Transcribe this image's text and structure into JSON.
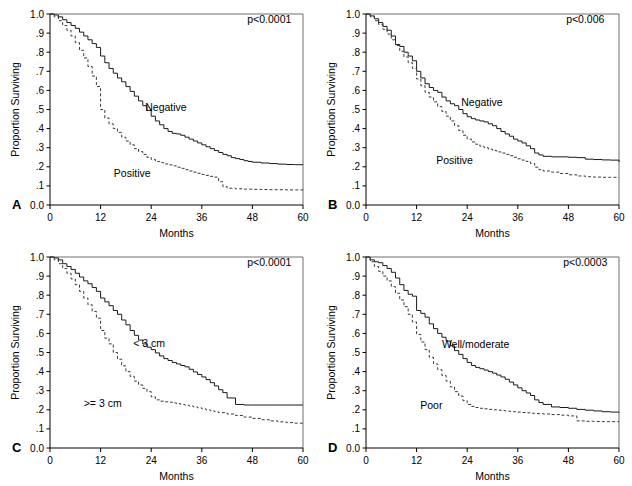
{
  "figure": {
    "title": "",
    "panel_count": 4,
    "shared": {
      "xlabel": "Months",
      "ylabel": "Proportion Surviving",
      "xticks": [
        "0",
        "12",
        "24",
        "36",
        "48",
        "60"
      ],
      "xtick_values": [
        0,
        12,
        24,
        36,
        48,
        60
      ],
      "yticks": [
        "0.0",
        ".1",
        ".2",
        ".3",
        ".4",
        ".5",
        ".6",
        ".7",
        ".8",
        ".9",
        "1.0"
      ],
      "ytick_values": [
        0.0,
        0.1,
        0.2,
        0.3,
        0.4,
        0.5,
        0.6,
        0.7,
        0.8,
        0.9,
        1.0
      ],
      "xlim": [
        0,
        60
      ],
      "ylim": [
        0,
        1
      ]
    }
  },
  "chart_data": [
    {
      "panel": "A",
      "type": "line",
      "title": "",
      "xlabel": "Months",
      "ylabel": "Proportion Surviving",
      "xlim": [
        0,
        60
      ],
      "ylim": [
        0,
        1
      ],
      "grid": false,
      "annotation": "p<0.0001",
      "annotation_pos": [
        52,
        0.955
      ],
      "legend": "inline-labels",
      "series": [
        {
          "name": "Negative",
          "style": "solid",
          "label_pos": [
            27.5,
            0.49
          ],
          "x": [
            0,
            1,
            2,
            3,
            4,
            5,
            6,
            7,
            8,
            9,
            10,
            11,
            12,
            13,
            14,
            15,
            16,
            17,
            18,
            19,
            20,
            21,
            22,
            23,
            24,
            25,
            26,
            27,
            28,
            29,
            30,
            31,
            32,
            33,
            34,
            35,
            36,
            37,
            38,
            39,
            40,
            41,
            42,
            43,
            44,
            45,
            46,
            47,
            48,
            50,
            52,
            54,
            56,
            58,
            60
          ],
          "y": [
            1.0,
            0.995,
            0.985,
            0.97,
            0.955,
            0.94,
            0.925,
            0.905,
            0.885,
            0.865,
            0.845,
            0.825,
            0.78,
            0.745,
            0.715,
            0.69,
            0.665,
            0.645,
            0.62,
            0.595,
            0.57,
            0.545,
            0.52,
            0.495,
            0.465,
            0.44,
            0.42,
            0.4,
            0.385,
            0.375,
            0.372,
            0.365,
            0.355,
            0.345,
            0.335,
            0.325,
            0.315,
            0.305,
            0.295,
            0.285,
            0.275,
            0.265,
            0.258,
            0.248,
            0.243,
            0.238,
            0.232,
            0.228,
            0.224,
            0.22,
            0.217,
            0.214,
            0.212,
            0.211,
            0.21
          ]
        },
        {
          "name": "Positive",
          "style": "dashed",
          "label_pos": [
            19.5,
            0.145
          ],
          "x": [
            0,
            1,
            2,
            3,
            4,
            5,
            6,
            7,
            8,
            9,
            10,
            11,
            12,
            13,
            14,
            15,
            16,
            17,
            18,
            19,
            20,
            21,
            22,
            23,
            24,
            25,
            26,
            27,
            28,
            29,
            30,
            31,
            32,
            33,
            34,
            35,
            36,
            37,
            38,
            39,
            40,
            41,
            42,
            44,
            46,
            48,
            50,
            52,
            54,
            56,
            58,
            60
          ],
          "y": [
            1.0,
            0.985,
            0.965,
            0.94,
            0.915,
            0.885,
            0.85,
            0.81,
            0.77,
            0.725,
            0.675,
            0.62,
            0.5,
            0.455,
            0.425,
            0.4,
            0.38,
            0.355,
            0.335,
            0.315,
            0.295,
            0.28,
            0.265,
            0.25,
            0.238,
            0.228,
            0.222,
            0.215,
            0.21,
            0.205,
            0.198,
            0.192,
            0.185,
            0.178,
            0.172,
            0.166,
            0.16,
            0.155,
            0.15,
            0.146,
            0.122,
            0.096,
            0.088,
            0.085,
            0.083,
            0.082,
            0.081,
            0.08,
            0.08,
            0.079,
            0.079,
            0.078
          ]
        }
      ]
    },
    {
      "panel": "B",
      "type": "line",
      "title": "",
      "xlabel": "Months",
      "ylabel": "Proportion Surviving",
      "xlim": [
        0,
        60
      ],
      "ylim": [
        0,
        1
      ],
      "grid": false,
      "annotation": "p<0.006",
      "annotation_pos": [
        52,
        0.955
      ],
      "legend": "inline-labels",
      "series": [
        {
          "name": "Negative",
          "style": "solid",
          "label_pos": [
            27.5,
            0.52
          ],
          "x": [
            0,
            1,
            2,
            3,
            4,
            5,
            6,
            7,
            8,
            9,
            10,
            11,
            12,
            13,
            14,
            15,
            16,
            17,
            18,
            19,
            20,
            21,
            22,
            23,
            24,
            25,
            26,
            27,
            28,
            29,
            30,
            31,
            32,
            33,
            34,
            35,
            36,
            37,
            38,
            39,
            40,
            41,
            42,
            44,
            46,
            48,
            50,
            52,
            54,
            56,
            58,
            60
          ],
          "y": [
            1.0,
            0.99,
            0.975,
            0.955,
            0.935,
            0.915,
            0.885,
            0.84,
            0.83,
            0.8,
            0.78,
            0.755,
            0.7,
            0.665,
            0.635,
            0.615,
            0.6,
            0.59,
            0.565,
            0.545,
            0.53,
            0.52,
            0.5,
            0.478,
            0.462,
            0.452,
            0.445,
            0.44,
            0.435,
            0.425,
            0.415,
            0.4,
            0.385,
            0.372,
            0.36,
            0.345,
            0.335,
            0.325,
            0.31,
            0.295,
            0.272,
            0.262,
            0.255,
            0.252,
            0.252,
            0.25,
            0.248,
            0.24,
            0.238,
            0.236,
            0.235,
            0.225
          ]
        },
        {
          "name": "Positive",
          "style": "dashed",
          "label_pos": [
            21,
            0.215
          ],
          "x": [
            0,
            1,
            2,
            3,
            4,
            5,
            6,
            7,
            8,
            9,
            10,
            11,
            12,
            13,
            14,
            15,
            16,
            17,
            18,
            19,
            20,
            21,
            22,
            23,
            24,
            25,
            26,
            27,
            28,
            29,
            30,
            31,
            32,
            33,
            34,
            35,
            36,
            37,
            38,
            39,
            40,
            41,
            42,
            44,
            46,
            48,
            50,
            52,
            54,
            56,
            58,
            60
          ],
          "y": [
            1.0,
            0.985,
            0.965,
            0.945,
            0.92,
            0.895,
            0.865,
            0.835,
            0.805,
            0.775,
            0.745,
            0.715,
            0.66,
            0.625,
            0.59,
            0.565,
            0.54,
            0.515,
            0.49,
            0.465,
            0.44,
            0.415,
            0.39,
            0.365,
            0.345,
            0.33,
            0.318,
            0.308,
            0.3,
            0.292,
            0.285,
            0.278,
            0.272,
            0.265,
            0.258,
            0.25,
            0.242,
            0.235,
            0.228,
            0.218,
            0.198,
            0.185,
            0.178,
            0.172,
            0.165,
            0.158,
            0.152,
            0.148,
            0.146,
            0.145,
            0.145,
            0.145
          ]
        }
      ]
    },
    {
      "panel": "C",
      "type": "line",
      "title": "",
      "xlabel": "Months",
      "ylabel": "Proportion Surviving",
      "xlim": [
        0,
        60
      ],
      "ylim": [
        0,
        1
      ],
      "grid": false,
      "annotation": "p<0.0001",
      "annotation_pos": [
        52,
        0.955
      ],
      "legend": "inline-labels",
      "series": [
        {
          "name": "< 3 cm",
          "style": "solid",
          "label_pos": [
            23.5,
            0.53
          ],
          "x": [
            0,
            1,
            2,
            3,
            4,
            5,
            6,
            7,
            8,
            9,
            10,
            11,
            12,
            13,
            14,
            15,
            16,
            17,
            18,
            19,
            20,
            21,
            22,
            23,
            24,
            25,
            26,
            27,
            28,
            29,
            30,
            31,
            32,
            33,
            34,
            35,
            36,
            37,
            38,
            39,
            40,
            41,
            42,
            44,
            46,
            48,
            50,
            52,
            54,
            56,
            58,
            60
          ],
          "y": [
            1.0,
            0.995,
            0.985,
            0.965,
            0.95,
            0.935,
            0.915,
            0.895,
            0.875,
            0.86,
            0.84,
            0.82,
            0.785,
            0.765,
            0.745,
            0.72,
            0.7,
            0.67,
            0.645,
            0.615,
            0.59,
            0.565,
            0.545,
            0.528,
            0.515,
            0.498,
            0.482,
            0.468,
            0.458,
            0.448,
            0.44,
            0.432,
            0.425,
            0.412,
            0.398,
            0.385,
            0.372,
            0.358,
            0.342,
            0.325,
            0.305,
            0.29,
            0.262,
            0.228,
            0.225,
            0.225,
            0.225,
            0.225,
            0.225,
            0.225,
            0.225,
            0.225
          ]
        },
        {
          "name": ">= 3 cm",
          "style": "dashed",
          "label_pos": [
            12.5,
            0.215
          ],
          "x": [
            0,
            1,
            2,
            3,
            4,
            5,
            6,
            7,
            8,
            9,
            10,
            11,
            12,
            13,
            14,
            15,
            16,
            17,
            18,
            19,
            20,
            21,
            22,
            23,
            24,
            25,
            26,
            27,
            28,
            29,
            30,
            31,
            32,
            33,
            34,
            35,
            36,
            37,
            38,
            39,
            40,
            42,
            44,
            46,
            48,
            50,
            52,
            54,
            56,
            58,
            60
          ],
          "y": [
            1.0,
            0.985,
            0.965,
            0.94,
            0.915,
            0.885,
            0.855,
            0.82,
            0.785,
            0.75,
            0.715,
            0.68,
            0.615,
            0.575,
            0.545,
            0.5,
            0.465,
            0.43,
            0.4,
            0.375,
            0.35,
            0.33,
            0.312,
            0.295,
            0.268,
            0.252,
            0.245,
            0.242,
            0.24,
            0.236,
            0.232,
            0.228,
            0.224,
            0.22,
            0.215,
            0.21,
            0.205,
            0.2,
            0.195,
            0.19,
            0.185,
            0.178,
            0.17,
            0.162,
            0.155,
            0.148,
            0.142,
            0.137,
            0.133,
            0.13,
            0.128
          ]
        }
      ]
    },
    {
      "panel": "D",
      "type": "line",
      "title": "",
      "xlabel": "Months",
      "ylabel": "Proportion Surviving",
      "xlim": [
        0,
        60
      ],
      "ylim": [
        0,
        1
      ],
      "grid": false,
      "annotation": "p<0.0003",
      "annotation_pos": [
        52,
        0.955
      ],
      "legend": "inline-labels",
      "series": [
        {
          "name": "Well/moderate",
          "style": "solid",
          "label_pos": [
            26,
            0.525
          ],
          "x": [
            0,
            1,
            2,
            3,
            4,
            5,
            6,
            7,
            8,
            9,
            10,
            11,
            12,
            13,
            14,
            15,
            16,
            17,
            18,
            19,
            20,
            21,
            22,
            23,
            24,
            25,
            26,
            27,
            28,
            29,
            30,
            31,
            32,
            33,
            34,
            35,
            36,
            37,
            38,
            39,
            40,
            41,
            42,
            44,
            46,
            48,
            50,
            52,
            54,
            56,
            58,
            60
          ],
          "y": [
            1.0,
            0.985,
            0.975,
            0.97,
            0.955,
            0.94,
            0.92,
            0.89,
            0.855,
            0.825,
            0.805,
            0.795,
            0.72,
            0.705,
            0.685,
            0.65,
            0.625,
            0.6,
            0.58,
            0.56,
            0.535,
            0.51,
            0.49,
            0.468,
            0.448,
            0.432,
            0.422,
            0.415,
            0.408,
            0.4,
            0.392,
            0.382,
            0.372,
            0.36,
            0.345,
            0.33,
            0.315,
            0.3,
            0.288,
            0.275,
            0.252,
            0.238,
            0.228,
            0.215,
            0.212,
            0.208,
            0.202,
            0.198,
            0.194,
            0.19,
            0.188,
            0.185
          ]
        },
        {
          "name": "Poor",
          "style": "dashed",
          "label_pos": [
            15.5,
            0.205
          ],
          "x": [
            0,
            1,
            2,
            3,
            4,
            5,
            6,
            7,
            8,
            9,
            10,
            11,
            12,
            13,
            14,
            15,
            16,
            17,
            18,
            19,
            20,
            21,
            22,
            23,
            24,
            25,
            26,
            27,
            28,
            29,
            30,
            31,
            32,
            33,
            34,
            35,
            36,
            37,
            38,
            39,
            40,
            42,
            44,
            46,
            48,
            50,
            52,
            54,
            56,
            58,
            60
          ],
          "y": [
            1.0,
            0.975,
            0.95,
            0.925,
            0.9,
            0.875,
            0.845,
            0.81,
            0.775,
            0.74,
            0.7,
            0.66,
            0.595,
            0.555,
            0.515,
            0.475,
            0.44,
            0.41,
            0.38,
            0.35,
            0.32,
            0.295,
            0.272,
            0.248,
            0.228,
            0.218,
            0.212,
            0.208,
            0.205,
            0.202,
            0.2,
            0.198,
            0.196,
            0.194,
            0.192,
            0.19,
            0.188,
            0.186,
            0.184,
            0.182,
            0.18,
            0.178,
            0.175,
            0.172,
            0.168,
            0.142,
            0.14,
            0.139,
            0.138,
            0.138,
            0.137
          ]
        }
      ]
    }
  ]
}
